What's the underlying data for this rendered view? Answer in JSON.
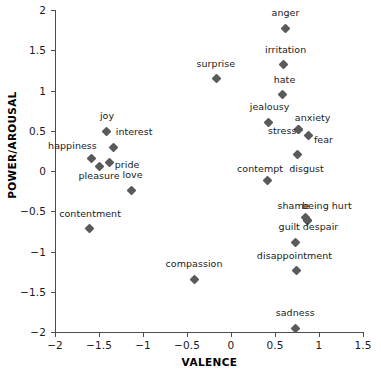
{
  "chart_data": {
    "type": "scatter",
    "title": "",
    "xlabel": "VALENCE",
    "ylabel": "POWER/AROUSAL",
    "xlim": [
      -2,
      1.5
    ],
    "ylim": [
      -2,
      2
    ],
    "xticks": [
      "-2",
      "-1.5",
      "-1",
      "-0.5",
      "0",
      "0.5",
      "1",
      "1.5"
    ],
    "xtick_values": [
      -2,
      -1.5,
      -1,
      -0.5,
      0,
      0.5,
      1,
      1.5
    ],
    "yticks": [
      "2",
      "1.5",
      "1",
      "0.5",
      "0",
      "-0.5",
      "-1",
      "-1.5",
      "-2"
    ],
    "ytick_values": [
      2,
      1.5,
      1,
      0.5,
      0,
      -0.5,
      -1,
      -1.5,
      -2
    ],
    "grid": false,
    "legend": false,
    "marker": "diamond",
    "marker_color": "#5a5a5a",
    "points": [
      {
        "label": "anger",
        "x": 0.62,
        "y": 1.77,
        "lx": 0.62,
        "ly": 1.96,
        "align": "center"
      },
      {
        "label": "irritation",
        "x": 0.6,
        "y": 1.32,
        "lx": 0.62,
        "ly": 1.5,
        "align": "center"
      },
      {
        "label": "surprise",
        "x": -0.17,
        "y": 1.15,
        "lx": -0.17,
        "ly": 1.33,
        "align": "center"
      },
      {
        "label": "hate",
        "x": 0.59,
        "y": 0.95,
        "lx": 0.61,
        "ly": 1.13,
        "align": "center"
      },
      {
        "label": "jealousy",
        "x": 0.43,
        "y": 0.6,
        "lx": 0.44,
        "ly": 0.79,
        "align": "center"
      },
      {
        "label": "anxiety",
        "x": 0.77,
        "y": 0.51,
        "lx": 0.93,
        "ly": 0.66,
        "align": "center"
      },
      {
        "label": "joy",
        "x": -1.41,
        "y": 0.49,
        "lx": -1.41,
        "ly": 0.68,
        "align": "center"
      },
      {
        "label": "stress",
        "x": 0.77,
        "y": 0.51,
        "lx": 0.58,
        "ly": 0.5,
        "align": "center"
      },
      {
        "label": "fear",
        "x": 0.88,
        "y": 0.44,
        "lx": 1.05,
        "ly": 0.38,
        "align": "center"
      },
      {
        "label": "interest",
        "x": -1.33,
        "y": 0.29,
        "lx": -1.1,
        "ly": 0.49,
        "align": "center"
      },
      {
        "label": "disgust",
        "x": 0.75,
        "y": 0.2,
        "lx": 0.86,
        "ly": 0.02,
        "align": "center"
      },
      {
        "label": "happiness",
        "x": -1.58,
        "y": 0.15,
        "lx": -1.8,
        "ly": 0.31,
        "align": "center"
      },
      {
        "label": "pride",
        "x": -1.38,
        "y": 0.1,
        "lx": -1.18,
        "ly": 0.08,
        "align": "center"
      },
      {
        "label": "pleasure",
        "x": -1.5,
        "y": 0.06,
        "lx": -1.5,
        "ly": -0.06,
        "align": "center"
      },
      {
        "label": "contempt",
        "x": 0.41,
        "y": -0.12,
        "lx": 0.33,
        "ly": 0.02,
        "align": "center"
      },
      {
        "label": "love",
        "x": -1.13,
        "y": -0.24,
        "lx": -1.12,
        "ly": -0.05,
        "align": "center"
      },
      {
        "label": "shame",
        "x": 0.85,
        "y": -0.58,
        "lx": 0.71,
        "ly": -0.44,
        "align": "center"
      },
      {
        "label": "being hurt",
        "x": 0.87,
        "y": -0.62,
        "lx": 1.09,
        "ly": -0.44,
        "align": "center"
      },
      {
        "label": "despair",
        "x": 0.87,
        "y": -0.62,
        "lx": 1.02,
        "ly": -0.7,
        "align": "center"
      },
      {
        "label": "contentment",
        "x": -1.61,
        "y": -0.71,
        "lx": -1.6,
        "ly": -0.53,
        "align": "center"
      },
      {
        "label": "guilt",
        "x": 0.73,
        "y": -0.89,
        "lx": 0.66,
        "ly": -0.7,
        "align": "center"
      },
      {
        "label": "disappointment",
        "x": 0.74,
        "y": -1.24,
        "lx": 0.72,
        "ly": -1.05,
        "align": "center"
      },
      {
        "label": "compassion",
        "x": -0.42,
        "y": -1.35,
        "lx": -0.42,
        "ly": -1.16,
        "align": "center"
      },
      {
        "label": "sadness",
        "x": 0.73,
        "y": -1.96,
        "lx": 0.73,
        "ly": -1.76,
        "align": "center"
      }
    ]
  }
}
